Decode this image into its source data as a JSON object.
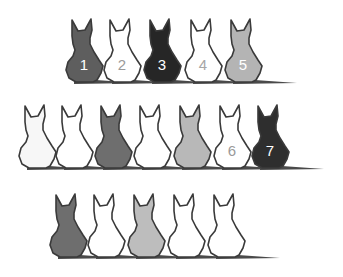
{
  "figure": {
    "rows": [
      {
        "name": "row-1",
        "y_bottom": 82,
        "cats": [
          {
            "x": 66,
            "fill": "#5e5e5e",
            "label": "1",
            "label_color": "#ffffff"
          },
          {
            "x": 104,
            "fill": "#ffffff",
            "label": "2",
            "label_color": "#9a9a9a"
          },
          {
            "x": 144,
            "fill": "#262626",
            "label": "3",
            "label_color": "#ffffff"
          },
          {
            "x": 185,
            "fill": "#ffffff",
            "label": "4",
            "label_color": "#a6a6a6"
          },
          {
            "x": 225,
            "fill": "#b4b4b4",
            "label": "5",
            "label_color": "#ffffff"
          }
        ]
      },
      {
        "name": "row-2",
        "y_bottom": 168,
        "cats": [
          {
            "x": 19,
            "fill": "#f7f7f7",
            "label": "",
            "label_color": "#000000"
          },
          {
            "x": 56,
            "fill": "#ffffff",
            "label": "",
            "label_color": "#000000"
          },
          {
            "x": 95,
            "fill": "#6e6e6e",
            "label": "",
            "label_color": "#000000"
          },
          {
            "x": 134,
            "fill": "#ffffff",
            "label": "",
            "label_color": "#000000"
          },
          {
            "x": 174,
            "fill": "#b8b8b8",
            "label": "",
            "label_color": "#000000"
          },
          {
            "x": 214,
            "fill": "#ffffff",
            "label": "6",
            "label_color": "#9a9a9a"
          },
          {
            "x": 252,
            "fill": "#2e2e2e",
            "label": "7",
            "label_color": "#ffffff"
          }
        ]
      },
      {
        "name": "row-3",
        "y_bottom": 257,
        "cats": [
          {
            "x": 50,
            "fill": "#6e6e6e",
            "label": "",
            "label_color": "#000000"
          },
          {
            "x": 88,
            "fill": "#ffffff",
            "label": "",
            "label_color": "#000000"
          },
          {
            "x": 128,
            "fill": "#bdbdbd",
            "label": "",
            "label_color": "#000000"
          },
          {
            "x": 168,
            "fill": "#ffffff",
            "label": "",
            "label_color": "#000000"
          },
          {
            "x": 208,
            "fill": "#ffffff",
            "label": "",
            "label_color": "#000000"
          }
        ]
      }
    ]
  }
}
